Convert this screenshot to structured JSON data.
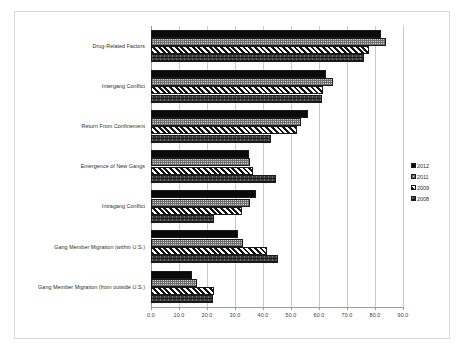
{
  "chart_data": {
    "type": "bar",
    "orientation": "horizontal",
    "title": "",
    "xlabel": "",
    "ylabel": "",
    "xlim": [
      0,
      90
    ],
    "xticks": [
      "0.0",
      "10.0",
      "20.0",
      "30.0",
      "40.0",
      "50.0",
      "60.0",
      "70.0",
      "80.0",
      "90.0"
    ],
    "xtick_step": 10,
    "grid": true,
    "legend_position": "right",
    "categories": [
      "Drug-Related Factors",
      "Intergang Conflict",
      "Return From Confinement",
      "Emergence of New Gangs",
      "Intragang Conflict",
      "Gang Member Migration (within U.S.)",
      "Gang Member Migration (from outside U.S.)"
    ],
    "series": [
      {
        "name": "2012",
        "pattern": "solid-black",
        "color": "#0a0a0a",
        "values": [
          82.0,
          62.5,
          56.0,
          35.0,
          37.5,
          31.0,
          14.5
        ]
      },
      {
        "name": "2011",
        "pattern": "light-checker",
        "color": "#d2d2d2",
        "values": [
          84.0,
          65.0,
          53.5,
          35.5,
          35.5,
          33.0,
          16.5
        ]
      },
      {
        "name": "2009",
        "pattern": "diagonal-hatch",
        "color": "#ffffff",
        "values": [
          78.0,
          61.5,
          52.0,
          36.5,
          32.5,
          41.5,
          22.5
        ]
      },
      {
        "name": "2008",
        "pattern": "dark-texture",
        "color": "#3d3d3d",
        "values": [
          76.0,
          61.0,
          43.0,
          44.5,
          22.5,
          45.5,
          22.0
        ]
      }
    ]
  },
  "legend": {
    "entries": [
      "2012",
      "2011",
      "2009",
      "2008"
    ]
  }
}
